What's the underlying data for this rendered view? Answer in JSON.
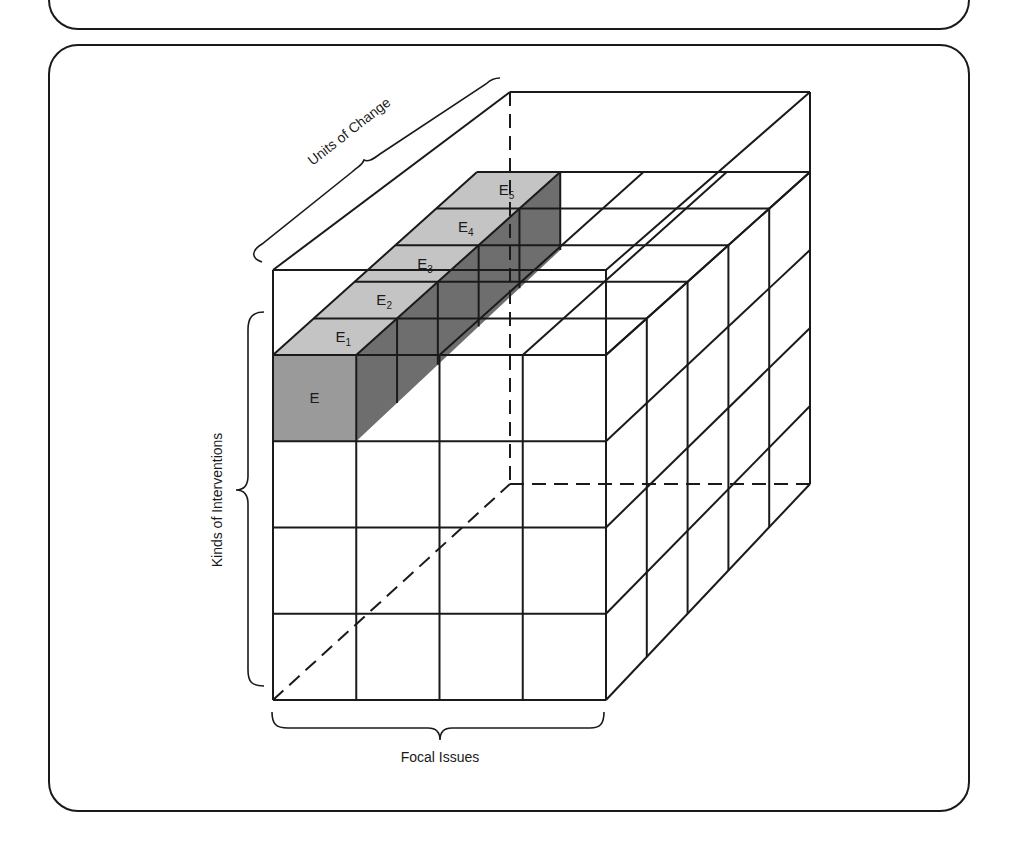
{
  "figure": {
    "type": "3D matrix cube diagram",
    "axes": {
      "depth_label": "Units of Change",
      "vertical_label": "Kinds of Interventions",
      "horizontal_label": "Focal Issues"
    },
    "grid": {
      "columns": 4,
      "rows": 4,
      "depth": 5
    },
    "highlighted_cells": {
      "front": "E",
      "top_sequence": [
        {
          "label": "E",
          "sub": "1"
        },
        {
          "label": "E",
          "sub": "2"
        },
        {
          "label": "E",
          "sub": "3"
        },
        {
          "label": "E",
          "sub": "4"
        },
        {
          "label": "E",
          "sub": "5"
        }
      ]
    },
    "colors": {
      "line": "#1a1a1a",
      "top_shade": "#c4c4c4",
      "front_shade": "#9a9a9a",
      "side_shade": "#6e6e6e"
    }
  }
}
